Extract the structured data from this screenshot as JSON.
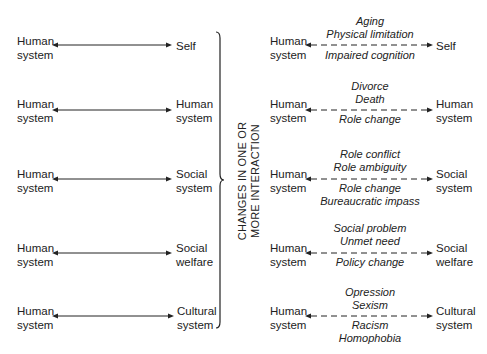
{
  "bracket_label": [
    "CHANGES IN ONE OR",
    "MORE INTERACTION"
  ],
  "left_rows": [
    {
      "from": [
        "Human",
        "system"
      ],
      "to": [
        "Self"
      ]
    },
    {
      "from": [
        "Human",
        "system"
      ],
      "to": [
        "Human",
        "system"
      ]
    },
    {
      "from": [
        "Human",
        "system"
      ],
      "to": [
        "Social",
        "system"
      ]
    },
    {
      "from": [
        "Human",
        "system"
      ],
      "to": [
        "Social",
        "welfare"
      ]
    },
    {
      "from": [
        "Human",
        "system"
      ],
      "to": [
        "Cultural",
        "system"
      ]
    }
  ],
  "right_rows": [
    {
      "from": [
        "Human",
        "system"
      ],
      "to": [
        "Self"
      ],
      "above": [
        "Aging",
        "Physical limitation"
      ],
      "below": [
        "Impaired cognition"
      ]
    },
    {
      "from": [
        "Human",
        "system"
      ],
      "to": [
        "Human",
        "system"
      ],
      "above": [
        "Divorce",
        "Death"
      ],
      "below": [
        "Role change"
      ]
    },
    {
      "from": [
        "Human",
        "system"
      ],
      "to": [
        "Social",
        "system"
      ],
      "above": [
        "Role conflict",
        "Role ambiguity"
      ],
      "below": [
        "Role change",
        "Bureaucratic impass"
      ]
    },
    {
      "from": [
        "Human",
        "system"
      ],
      "to": [
        "Social",
        "welfare"
      ],
      "above": [
        "Social problem",
        "Unmet need"
      ],
      "below": [
        "Policy change"
      ]
    },
    {
      "from": [
        "Human",
        "system"
      ],
      "to": [
        "Cultural",
        "system"
      ],
      "above": [
        "Opression",
        "Sexism"
      ],
      "below": [
        "Racism",
        "Homophobia"
      ]
    }
  ]
}
